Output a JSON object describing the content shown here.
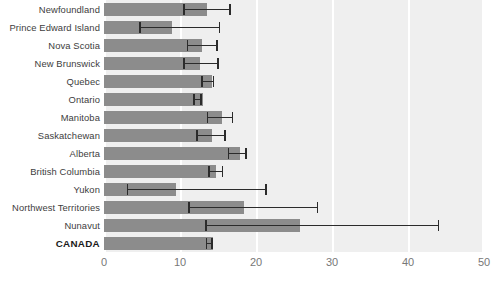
{
  "chart_data": {
    "type": "bar",
    "orientation": "horizontal",
    "title": "",
    "subtitle": "",
    "xlabel": "",
    "ylabel": "",
    "xlim": [
      0,
      50
    ],
    "xticks": [
      0,
      10,
      20,
      30,
      40,
      50
    ],
    "xtick_labels": [
      "0",
      "10",
      "20",
      "30",
      "40",
      "50"
    ],
    "grid": "vertical white gridlines at each x tick",
    "legend": "none",
    "bar_color": "#8c8c8c",
    "error_color": "#2b2b2b",
    "panel_color": "#efefef",
    "error_bars": "95% confidence interval (low, high)",
    "categories": [
      "Newfoundland",
      "Prince Edward Island",
      "Nova Scotia",
      "New Brunswick",
      "Quebec",
      "Ontario",
      "Manitoba",
      "Saskatchewan",
      "Alberta",
      "British Columbia",
      "Yukon",
      "Northwest Territories",
      "Nunavut",
      "CANADA"
    ],
    "emphasized_categories": [
      "CANADA"
    ],
    "values": [
      13.6,
      8.9,
      12.9,
      12.6,
      14.2,
      13.0,
      15.5,
      14.2,
      17.9,
      14.7,
      9.5,
      18.4,
      25.8,
      14.3
    ],
    "error_low": [
      10.4,
      4.6,
      10.9,
      10.4,
      12.8,
      11.7,
      13.5,
      12.1,
      16.3,
      13.7,
      3.0,
      11.1,
      13.3,
      13.4
    ],
    "error_high": [
      16.7,
      15.3,
      15.0,
      15.1,
      14.5,
      12.9,
      17.0,
      16.0,
      18.8,
      15.7,
      21.4,
      28.2,
      44.1,
      14.3
    ]
  }
}
